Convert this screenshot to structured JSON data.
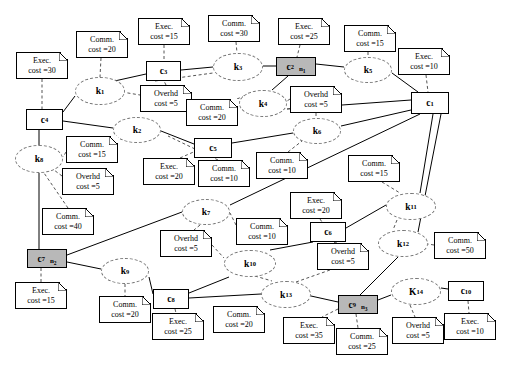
{
  "diagram": {
    "colors": {
      "shaded_node": "#b8b8b8",
      "node_border": "#000000",
      "task_border": "#777777",
      "edge": "#000000",
      "background": "#ffffff"
    },
    "tasks": [
      {
        "id": "k1",
        "label": "k",
        "sub": "1",
        "x": 75,
        "y": 77,
        "w": 50,
        "h": 28
      },
      {
        "id": "k2",
        "label": "k",
        "sub": "2",
        "x": 113,
        "y": 117,
        "w": 48,
        "h": 26
      },
      {
        "id": "k3",
        "label": "k",
        "sub": "3",
        "x": 213,
        "y": 53,
        "w": 50,
        "h": 28
      },
      {
        "id": "k4",
        "label": "k",
        "sub": "4",
        "x": 239,
        "y": 90,
        "w": 48,
        "h": 27
      },
      {
        "id": "k5",
        "label": "k",
        "sub": "5",
        "x": 344,
        "y": 57,
        "w": 48,
        "h": 26
      },
      {
        "id": "k6",
        "label": "k",
        "sub": "6",
        "x": 293,
        "y": 118,
        "w": 48,
        "h": 26
      },
      {
        "id": "k7",
        "label": "k",
        "sub": "7",
        "x": 182,
        "y": 199,
        "w": 48,
        "h": 26
      },
      {
        "id": "k8",
        "label": "k",
        "sub": "8",
        "x": 15,
        "y": 145,
        "w": 48,
        "h": 28
      },
      {
        "id": "k9",
        "label": "k",
        "sub": "9",
        "x": 101,
        "y": 258,
        "w": 48,
        "h": 26
      },
      {
        "id": "k10",
        "label": "k",
        "sub": "10",
        "x": 224,
        "y": 250,
        "w": 52,
        "h": 27
      },
      {
        "id": "k11",
        "label": "k",
        "sub": "11",
        "x": 386,
        "y": 193,
        "w": 50,
        "h": 27
      },
      {
        "id": "k12",
        "label": "k",
        "sub": "12",
        "x": 378,
        "y": 230,
        "w": 50,
        "h": 27
      },
      {
        "id": "k13",
        "label": "k",
        "sub": "13",
        "x": 261,
        "y": 281,
        "w": 50,
        "h": 27
      },
      {
        "id": "K14",
        "label": "K",
        "sub": "14",
        "x": 391,
        "y": 278,
        "w": 50,
        "h": 27
      }
    ],
    "components": [
      {
        "id": "c1",
        "label": "c",
        "sub": "1",
        "x": 411,
        "y": 92,
        "w": 38,
        "h": 22,
        "shaded": false,
        "alloc": ""
      },
      {
        "id": "c2",
        "label": "c",
        "sub": "2",
        "x": 276,
        "y": 57,
        "w": 40,
        "h": 19,
        "shaded": true,
        "alloc": "n",
        "alloc_sub": "1"
      },
      {
        "id": "c3",
        "label": "c",
        "sub": "3",
        "x": 146,
        "y": 61,
        "w": 35,
        "h": 20,
        "shaded": false,
        "alloc": ""
      },
      {
        "id": "c4",
        "label": "c",
        "sub": "4",
        "x": 26,
        "y": 109,
        "w": 37,
        "h": 21,
        "shaded": false,
        "alloc": ""
      },
      {
        "id": "c5",
        "label": "c",
        "sub": "5",
        "x": 194,
        "y": 138,
        "w": 38,
        "h": 20,
        "shaded": false,
        "alloc": ""
      },
      {
        "id": "c6",
        "label": "c",
        "sub": "6",
        "x": 310,
        "y": 222,
        "w": 36,
        "h": 20,
        "shaded": false,
        "alloc": ""
      },
      {
        "id": "c7",
        "label": "c",
        "sub": "7",
        "x": 27,
        "y": 249,
        "w": 40,
        "h": 19,
        "shaded": true,
        "alloc": "n",
        "alloc_sub": "2"
      },
      {
        "id": "c8",
        "label": "c",
        "sub": "8",
        "x": 153,
        "y": 289,
        "w": 36,
        "h": 20,
        "shaded": false,
        "alloc": ""
      },
      {
        "id": "c9",
        "label": "c",
        "sub": "9",
        "x": 338,
        "y": 295,
        "w": 40,
        "h": 19,
        "shaded": true,
        "alloc": "n",
        "alloc_sub": "3"
      },
      {
        "id": "c10",
        "label": "c",
        "sub": "10",
        "x": 448,
        "y": 281,
        "w": 36,
        "h": 20,
        "shaded": false,
        "alloc": ""
      }
    ],
    "notes": [
      {
        "id": "n-exec-c4",
        "kind": "Exec.",
        "line1": "Exec.",
        "line2": "cost =30",
        "x": 16,
        "y": 52,
        "w": 52,
        "h": 27
      },
      {
        "id": "n-comm-k1",
        "kind": "Comm.",
        "line1": "Comm.",
        "line2": "cost =20",
        "x": 76,
        "y": 31,
        "w": 52,
        "h": 27
      },
      {
        "id": "n-exec-c3",
        "kind": "Exec.",
        "line1": "Exec.",
        "line2": "cost =15",
        "x": 138,
        "y": 18,
        "w": 52,
        "h": 27
      },
      {
        "id": "n-comm-k3",
        "kind": "Comm.",
        "line1": "Comm.",
        "line2": "cost =30",
        "x": 208,
        "y": 15,
        "w": 52,
        "h": 27
      },
      {
        "id": "n-exec-c2",
        "kind": "Exec.",
        "line1": "Exec.",
        "line2": "cost =25",
        "x": 278,
        "y": 18,
        "w": 52,
        "h": 27
      },
      {
        "id": "n-comm-k5",
        "kind": "Comm.",
        "line1": "Comm.",
        "line2": "cost =15",
        "x": 344,
        "y": 25,
        "w": 52,
        "h": 27
      },
      {
        "id": "n-exec-c1",
        "kind": "Exec.",
        "line1": "Exec.",
        "line2": "cost =10",
        "x": 398,
        "y": 48,
        "w": 52,
        "h": 27
      },
      {
        "id": "n-ovhd-k1k3",
        "kind": "Overhd",
        "line1": "Overhd",
        "line2": "cost =5",
        "x": 140,
        "y": 85,
        "w": 52,
        "h": 27
      },
      {
        "id": "n-comm-k4",
        "kind": "Comm.",
        "line1": "Comm.",
        "line2": "cost =20",
        "x": 186,
        "y": 99,
        "w": 52,
        "h": 27
      },
      {
        "id": "n-ovhd-k4k6",
        "kind": "Overhd",
        "line1": "Overhd",
        "line2": "cost =5",
        "x": 290,
        "y": 86,
        "w": 52,
        "h": 27
      },
      {
        "id": "n-comm-k8",
        "kind": "Comm.",
        "line1": "Comm.",
        "line2": "cost =15",
        "x": 66,
        "y": 136,
        "w": 52,
        "h": 27
      },
      {
        "id": "n-exec-c5",
        "kind": "Exec.",
        "line1": "Exec.",
        "line2": "cost =20",
        "x": 143,
        "y": 158,
        "w": 52,
        "h": 27
      },
      {
        "id": "n-comm-c5",
        "kind": "Comm.",
        "line1": "Comm.",
        "line2": "cost =10",
        "x": 198,
        "y": 160,
        "w": 52,
        "h": 27
      },
      {
        "id": "n-comm-k6",
        "kind": "Comm.",
        "line1": "Comm.",
        "line2": "cost =10",
        "x": 256,
        "y": 152,
        "w": 52,
        "h": 27
      },
      {
        "id": "n-comm-k11",
        "kind": "Comm.",
        "line1": "Comm.",
        "line2": "cost =15",
        "x": 348,
        "y": 155,
        "w": 52,
        "h": 27
      },
      {
        "id": "n-ovhd-k8",
        "kind": "Overhd",
        "line1": "Overhd",
        "line2": "cost =5",
        "x": 62,
        "y": 168,
        "w": 52,
        "h": 27
      },
      {
        "id": "n-exec-c6",
        "kind": "Exec.",
        "line1": "Exec.",
        "line2": "cost =20",
        "x": 290,
        "y": 192,
        "w": 52,
        "h": 27
      },
      {
        "id": "n-comm-k7",
        "kind": "Comm.",
        "line1": "Comm.",
        "line2": "cost =10",
        "x": 236,
        "y": 218,
        "w": 52,
        "h": 27
      },
      {
        "id": "n-comm-c7",
        "kind": "Comm.",
        "line1": "Comm.",
        "line2": "cost =40",
        "x": 42,
        "y": 208,
        "w": 52,
        "h": 27
      },
      {
        "id": "n-ovhd-k7",
        "kind": "Overhd",
        "line1": "Overhd",
        "line2": "cost =5",
        "x": 160,
        "y": 230,
        "w": 52,
        "h": 27
      },
      {
        "id": "n-ovhd-c6",
        "kind": "Overhd",
        "line1": "Overhd",
        "line2": "cost =5",
        "x": 317,
        "y": 243,
        "w": 52,
        "h": 27
      },
      {
        "id": "n-comm-k12",
        "kind": "Comm.",
        "line1": "Comm.",
        "line2": "cost =50",
        "x": 434,
        "y": 232,
        "w": 52,
        "h": 27
      },
      {
        "id": "n-exec-c7",
        "kind": "Exec.",
        "line1": "Exec.",
        "line2": "cost =15",
        "x": 15,
        "y": 282,
        "w": 52,
        "h": 27
      },
      {
        "id": "n-comm-k9",
        "kind": "Comm.",
        "line1": "Comm.",
        "line2": "cost =20",
        "x": 99,
        "y": 296,
        "w": 52,
        "h": 27
      },
      {
        "id": "n-exec-c8",
        "kind": "Exec.",
        "line1": "Exec.",
        "line2": "cost =25",
        "x": 152,
        "y": 313,
        "w": 52,
        "h": 27
      },
      {
        "id": "n-comm-c8",
        "kind": "Comm.",
        "line1": "Comm.",
        "line2": "cost =20",
        "x": 213,
        "y": 306,
        "w": 52,
        "h": 27
      },
      {
        "id": "n-exec-c9",
        "kind": "Exec.",
        "line1": "Exec.",
        "line2": "cost =35",
        "x": 283,
        "y": 317,
        "w": 52,
        "h": 27
      },
      {
        "id": "n-comm-c9",
        "kind": "Comm.",
        "line1": "Comm.",
        "line2": "cost =25",
        "x": 336,
        "y": 328,
        "w": 52,
        "h": 27
      },
      {
        "id": "n-ovhd-K14",
        "kind": "Overhd",
        "line1": "Overhd",
        "line2": "cost =5",
        "x": 392,
        "y": 317,
        "w": 52,
        "h": 27
      },
      {
        "id": "n-exec-c10",
        "kind": "Exec.",
        "line1": "Exec.",
        "line2": "cost =10",
        "x": 444,
        "y": 313,
        "w": 52,
        "h": 27
      }
    ],
    "solid_edges": [
      {
        "from": "c3",
        "to": "k1",
        "x1": 146,
        "y1": 74,
        "x2": 110,
        "y2": 82
      },
      {
        "from": "c3",
        "to": "k3",
        "x1": 181,
        "y1": 70,
        "x2": 213,
        "y2": 67
      },
      {
        "from": "k3",
        "to": "c2",
        "x1": 263,
        "y1": 66,
        "x2": 276,
        "y2": 66
      },
      {
        "from": "c2",
        "to": "k5",
        "x1": 316,
        "y1": 64,
        "x2": 344,
        "y2": 67
      },
      {
        "from": "c2",
        "to": "k4",
        "x1": 288,
        "y1": 76,
        "x2": 272,
        "y2": 90
      },
      {
        "from": "k5",
        "to": "c1",
        "x1": 392,
        "y1": 73,
        "x2": 418,
        "y2": 92
      },
      {
        "from": "k4",
        "to": "c1",
        "x1": 287,
        "y1": 109,
        "x2": 411,
        "y2": 100
      },
      {
        "from": "k1",
        "to": "c4",
        "x1": 75,
        "y1": 96,
        "x2": 63,
        "y2": 112
      },
      {
        "from": "c4",
        "to": "k2",
        "x1": 63,
        "y1": 121,
        "x2": 113,
        "y2": 128
      },
      {
        "from": "c4",
        "to": "k8",
        "x1": 39,
        "y1": 130,
        "x2": 39,
        "y2": 145
      },
      {
        "from": "k2",
        "to": "c5",
        "x1": 161,
        "y1": 131,
        "x2": 194,
        "y2": 144
      },
      {
        "from": "c5",
        "to": "k6",
        "x1": 232,
        "y1": 143,
        "x2": 293,
        "y2": 133
      },
      {
        "from": "k6",
        "to": "c1",
        "x1": 341,
        "y1": 126,
        "x2": 411,
        "y2": 110
      },
      {
        "from": "k8",
        "to": "c7",
        "x1": 39,
        "y1": 173,
        "x2": 39,
        "y2": 249
      },
      {
        "from": "c7",
        "to": "k7",
        "x1": 67,
        "y1": 255,
        "x2": 182,
        "y2": 212
      },
      {
        "from": "c7",
        "to": "k9",
        "x1": 67,
        "y1": 262,
        "x2": 101,
        "y2": 269
      },
      {
        "from": "k7",
        "to": "c1",
        "x1": 230,
        "y1": 205,
        "x2": 420,
        "y2": 114
      },
      {
        "from": "k9",
        "to": "c8",
        "x1": 149,
        "y1": 277,
        "x2": 153,
        "y2": 294
      },
      {
        "from": "c8",
        "to": "k10",
        "x1": 189,
        "y1": 293,
        "x2": 229,
        "y2": 277
      },
      {
        "from": "c8",
        "to": "k13",
        "x1": 189,
        "y1": 298,
        "x2": 261,
        "y2": 294
      },
      {
        "from": "k10",
        "to": "c6",
        "x1": 270,
        "y1": 250,
        "x2": 313,
        "y2": 242
      },
      {
        "from": "c6",
        "to": "k11",
        "x1": 346,
        "y1": 228,
        "x2": 386,
        "y2": 205
      },
      {
        "from": "k11",
        "to": "c1",
        "x1": 420,
        "y1": 193,
        "x2": 433,
        "y2": 114
      },
      {
        "from": "k12",
        "to": "c1",
        "x1": 418,
        "y1": 232,
        "x2": 441,
        "y2": 114
      },
      {
        "from": "k12",
        "to": "c9",
        "x1": 398,
        "y1": 257,
        "x2": 360,
        "y2": 295
      },
      {
        "from": "k13",
        "to": "c9",
        "x1": 311,
        "y1": 296,
        "x2": 338,
        "y2": 302
      },
      {
        "from": "c9",
        "to": "K14",
        "x1": 378,
        "y1": 300,
        "x2": 391,
        "y2": 295
      },
      {
        "from": "K14",
        "to": "c10",
        "x1": 441,
        "y1": 288,
        "x2": 448,
        "y2": 289
      }
    ],
    "dashed_edges": [
      {
        "from": "n-exec-c4",
        "to": "c4",
        "x1": 42,
        "y1": 79,
        "x2": 42,
        "y2": 109
      },
      {
        "from": "n-comm-k1",
        "to": "k1",
        "x1": 101,
        "y1": 58,
        "x2": 100,
        "y2": 77
      },
      {
        "from": "n-exec-c3",
        "to": "c3",
        "x1": 164,
        "y1": 45,
        "x2": 164,
        "y2": 61
      },
      {
        "from": "n-comm-k3",
        "to": "k3",
        "x1": 236,
        "y1": 42,
        "x2": 237,
        "y2": 53
      },
      {
        "from": "n-exec-c2",
        "to": "c2",
        "x1": 300,
        "y1": 45,
        "x2": 297,
        "y2": 57
      },
      {
        "from": "n-comm-k5",
        "to": "k5",
        "x1": 368,
        "y1": 52,
        "x2": 368,
        "y2": 57
      },
      {
        "from": "n-exec-c1",
        "to": "c1",
        "x1": 426,
        "y1": 75,
        "x2": 428,
        "y2": 92
      },
      {
        "from": "k1",
        "to": "n-ovhd-k1k3",
        "x1": 122,
        "y1": 92,
        "x2": 140,
        "y2": 95
      },
      {
        "from": "n-ovhd-k1k3",
        "to": "c3",
        "x1": 166,
        "y1": 85,
        "x2": 164,
        "y2": 81
      },
      {
        "from": "c3",
        "to": "k3-dash",
        "x1": 155,
        "y1": 81,
        "x2": 213,
        "y2": 73
      },
      {
        "from": "n-comm-k4",
        "to": "k4",
        "x1": 237,
        "y1": 99,
        "x2": 244,
        "y2": 96
      },
      {
        "from": "n-ovhd-k4k6",
        "to": "k4",
        "x1": 290,
        "y1": 99,
        "x2": 287,
        "y2": 101
      },
      {
        "from": "n-ovhd-k4k6",
        "to": "k6",
        "x1": 316,
        "y1": 113,
        "x2": 316,
        "y2": 118
      },
      {
        "from": "n-comm-k8",
        "to": "k8",
        "x1": 66,
        "y1": 152,
        "x2": 63,
        "y2": 157
      },
      {
        "from": "n-ovhd-k8",
        "to": "k8",
        "x1": 62,
        "y1": 176,
        "x2": 54,
        "y2": 170
      },
      {
        "from": "n-comm-c7",
        "to": "k8",
        "x1": 68,
        "y1": 208,
        "x2": 44,
        "y2": 173
      },
      {
        "from": "n-exec-c5",
        "to": "c5",
        "x1": 180,
        "y1": 158,
        "x2": 198,
        "y2": 150
      },
      {
        "from": "n-comm-c5",
        "to": "c5",
        "x1": 218,
        "y1": 160,
        "x2": 214,
        "y2": 158
      },
      {
        "from": "n-comm-k6",
        "to": "k6",
        "x1": 288,
        "y1": 152,
        "x2": 302,
        "y2": 141
      },
      {
        "from": "n-comm-k11",
        "to": "k11",
        "x1": 382,
        "y1": 182,
        "x2": 400,
        "y2": 193
      },
      {
        "from": "n-exec-c6",
        "to": "c6",
        "x1": 320,
        "y1": 219,
        "x2": 322,
        "y2": 222
      },
      {
        "from": "n-comm-k7",
        "to": "k7",
        "x1": 236,
        "y1": 225,
        "x2": 230,
        "y2": 213
      },
      {
        "from": "k7",
        "to": "n-ovhd-k7",
        "x1": 200,
        "y1": 225,
        "x2": 194,
        "y2": 230
      },
      {
        "from": "n-ovhd-k7",
        "to": "k10",
        "x1": 212,
        "y1": 245,
        "x2": 224,
        "y2": 258
      },
      {
        "from": "n-ovhd-c6",
        "to": "c6",
        "x1": 337,
        "y1": 243,
        "x2": 332,
        "y2": 242
      },
      {
        "from": "k11",
        "to": "k12",
        "x1": 397,
        "y1": 220,
        "x2": 393,
        "y2": 230
      },
      {
        "from": "n-comm-k12",
        "to": "k12",
        "x1": 434,
        "y1": 245,
        "x2": 428,
        "y2": 244
      },
      {
        "from": "c7",
        "to": "n-exec-c7",
        "x1": 41,
        "y1": 268,
        "x2": 41,
        "y2": 282
      },
      {
        "from": "k9",
        "to": "n-comm-k9",
        "x1": 125,
        "y1": 284,
        "x2": 125,
        "y2": 296
      },
      {
        "from": "c8",
        "to": "n-exec-c8",
        "x1": 175,
        "y1": 309,
        "x2": 176,
        "y2": 313
      },
      {
        "from": "c9",
        "to": "n-exec-c9",
        "x1": 338,
        "y1": 309,
        "x2": 322,
        "y2": 317
      },
      {
        "from": "c9",
        "to": "n-comm-c9",
        "x1": 356,
        "y1": 314,
        "x2": 358,
        "y2": 328
      },
      {
        "from": "K14",
        "to": "n-ovhd-K14",
        "x1": 410,
        "y1": 305,
        "x2": 415,
        "y2": 317
      },
      {
        "from": "c10",
        "to": "n-exec-c10",
        "x1": 468,
        "y1": 301,
        "x2": 469,
        "y2": 313
      },
      {
        "from": "k13",
        "to": "n-ovhd-c6",
        "x1": 296,
        "y1": 282,
        "x2": 330,
        "y2": 270
      },
      {
        "from": "k10",
        "to": "k13",
        "x1": 255,
        "y1": 276,
        "x2": 272,
        "y2": 281
      },
      {
        "from": "c5",
        "to": "k2-dash",
        "x1": 195,
        "y1": 149,
        "x2": 168,
        "y2": 136
      }
    ]
  }
}
